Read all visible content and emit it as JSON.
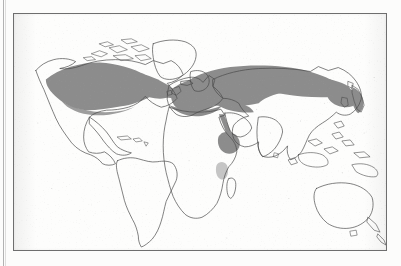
{
  "figure": {
    "kind": "world-distribution-map",
    "frame_visible": true,
    "caption": "",
    "background_color": "#fcfcfb",
    "frame_color": "#6e6e6e"
  },
  "legend": {
    "shaded_label": "",
    "shaded_color": "#8c8c8c",
    "unshaded_color": "#ffffff",
    "coastline_color": "#4a4a4a"
  },
  "map": {
    "projection": "equirectangular",
    "landmasses": [
      {
        "name": "north-america",
        "shaded": true
      },
      {
        "name": "greenland",
        "shaded": false
      },
      {
        "name": "south-america",
        "shaded": false
      },
      {
        "name": "europe",
        "shaded": true
      },
      {
        "name": "africa",
        "shaded": false
      },
      {
        "name": "asia",
        "shaded": true
      },
      {
        "name": "australia",
        "shaded": false
      },
      {
        "name": "new-zealand",
        "shaded": false
      },
      {
        "name": "japan",
        "shaded": true
      },
      {
        "name": "madagascar",
        "shaded": false
      },
      {
        "name": "indonesia",
        "shaded": false
      },
      {
        "name": "antarctica",
        "shaded": false
      }
    ],
    "distribution_regions": [
      {
        "name": "north-america-range",
        "description": "eastern and central United States and southern Canada",
        "tone": "dark"
      },
      {
        "name": "eurasia-range",
        "description": "Europe across Siberia to the Pacific coast",
        "tone": "dark"
      },
      {
        "name": "japan-korea-range",
        "description": "Japan, Korea and northeast China",
        "tone": "dark"
      },
      {
        "name": "red-sea-corridor",
        "description": "narrow strip along the Red Sea and Arabian margin",
        "tone": "dark"
      },
      {
        "name": "ethiopia-range",
        "description": "Ethiopian highlands and Horn of Africa",
        "tone": "dark"
      },
      {
        "name": "east-africa-patch",
        "description": "small patch in the East African lakes region",
        "tone": "light"
      }
    ],
    "gaps": [
      {
        "name": "central-asia-gap",
        "description": "unshaded area around the Caspian and Central Asian deserts"
      },
      {
        "name": "mongolia-gap",
        "description": "unshaded area over Mongolia and northern China"
      },
      {
        "name": "scandinavia-gap",
        "description": "unshaded far northern Scandinavia"
      }
    ]
  }
}
